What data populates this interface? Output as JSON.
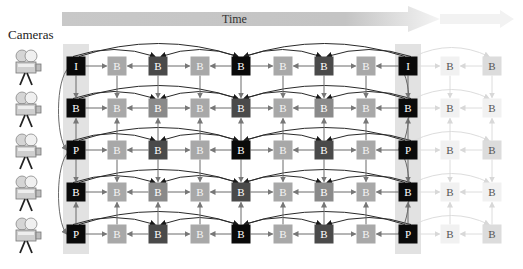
{
  "cameras_label": "Cameras",
  "time_label": "Time",
  "colors": {
    "black": "#0a0a0a",
    "dark": "#4a4a4a",
    "mid": "#8a8a8a",
    "light": "#a8a8a8",
    "faded": "#e6e6e6",
    "faded_text": "#555555",
    "gop_band": "#e2e2e2",
    "arrow": "#666666",
    "time_arrow": "#cfcfcf"
  },
  "columns_x": [
    76,
    117,
    158,
    200,
    241,
    283,
    324,
    366,
    408,
    450,
    492
  ],
  "rows_y": [
    66,
    108,
    150,
    192,
    234
  ],
  "grid": [
    [
      {
        "t": "I",
        "s": "black"
      },
      {
        "t": "B",
        "s": "light"
      },
      {
        "t": "B",
        "s": "dark"
      },
      {
        "t": "B",
        "s": "light"
      },
      {
        "t": "B",
        "s": "black"
      },
      {
        "t": "B",
        "s": "light"
      },
      {
        "t": "B",
        "s": "dark"
      },
      {
        "t": "B",
        "s": "light"
      },
      {
        "t": "I",
        "s": "black"
      },
      {
        "t": "B",
        "s": "faded"
      },
      {
        "t": "B",
        "s": "fadedmid"
      }
    ],
    [
      {
        "t": "B",
        "s": "black"
      },
      {
        "t": "B",
        "s": "light"
      },
      {
        "t": "B",
        "s": "mid"
      },
      {
        "t": "B",
        "s": "light"
      },
      {
        "t": "B",
        "s": "dark"
      },
      {
        "t": "B",
        "s": "light"
      },
      {
        "t": "B",
        "s": "mid"
      },
      {
        "t": "B",
        "s": "light"
      },
      {
        "t": "B",
        "s": "black"
      },
      {
        "t": "B",
        "s": "faded"
      },
      {
        "t": "B",
        "s": "faded"
      }
    ],
    [
      {
        "t": "P",
        "s": "black"
      },
      {
        "t": "B",
        "s": "light"
      },
      {
        "t": "B",
        "s": "dark"
      },
      {
        "t": "B",
        "s": "light"
      },
      {
        "t": "B",
        "s": "black"
      },
      {
        "t": "B",
        "s": "light"
      },
      {
        "t": "B",
        "s": "dark"
      },
      {
        "t": "B",
        "s": "light"
      },
      {
        "t": "P",
        "s": "black"
      },
      {
        "t": "B",
        "s": "faded"
      },
      {
        "t": "B",
        "s": "fadedmid"
      }
    ],
    [
      {
        "t": "B",
        "s": "black"
      },
      {
        "t": "B",
        "s": "light"
      },
      {
        "t": "B",
        "s": "mid"
      },
      {
        "t": "B",
        "s": "light"
      },
      {
        "t": "B",
        "s": "dark"
      },
      {
        "t": "B",
        "s": "light"
      },
      {
        "t": "B",
        "s": "mid"
      },
      {
        "t": "B",
        "s": "light"
      },
      {
        "t": "B",
        "s": "black"
      },
      {
        "t": "B",
        "s": "faded"
      },
      {
        "t": "B",
        "s": "faded"
      }
    ],
    [
      {
        "t": "P",
        "s": "black"
      },
      {
        "t": "B",
        "s": "light"
      },
      {
        "t": "B",
        "s": "dark"
      },
      {
        "t": "B",
        "s": "light"
      },
      {
        "t": "B",
        "s": "black"
      },
      {
        "t": "B",
        "s": "light"
      },
      {
        "t": "B",
        "s": "dark"
      },
      {
        "t": "B",
        "s": "light"
      },
      {
        "t": "P",
        "s": "black"
      },
      {
        "t": "B",
        "s": "faded"
      },
      {
        "t": "B",
        "s": "fadedmid"
      }
    ]
  ],
  "cameras": [
    {
      "label": "camera-1"
    },
    {
      "label": "camera-2"
    },
    {
      "label": "camera-3"
    },
    {
      "label": "camera-4"
    },
    {
      "label": "camera-5"
    }
  ]
}
